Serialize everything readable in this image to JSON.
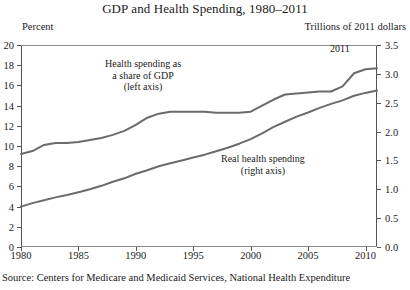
{
  "chart_data": {
    "type": "line",
    "title": "GDP and Health Spending, 1980–2011",
    "xlabel": "",
    "ylabel": "Percent",
    "y2label": "Trillions of 2011 dollars",
    "xlim": [
      1980,
      2011
    ],
    "ylim": [
      0,
      20
    ],
    "y2lim": [
      0,
      3.5
    ],
    "grid": false,
    "legend": "annotations-inline",
    "x_ticks": [
      1980,
      1985,
      1990,
      1995,
      2000,
      2005,
      2010
    ],
    "x_tick_labels": [
      "1980",
      "1985",
      "1990",
      "1995",
      "2000",
      "2005",
      "2010"
    ],
    "y_ticks": [
      0,
      2,
      4,
      6,
      8,
      10,
      12,
      14,
      16,
      18,
      20
    ],
    "y_tick_labels": [
      "0",
      "2",
      "4",
      "6",
      "8",
      "10",
      "12",
      "14",
      "16",
      "18",
      "20"
    ],
    "y2_ticks": [
      0.0,
      0.5,
      1.0,
      1.5,
      2.0,
      2.5,
      3.0,
      3.5
    ],
    "y2_tick_labels": [
      "0.0",
      "0.5",
      "1.0",
      "1.5",
      "2.0",
      "2.5",
      "3.0",
      "3.5"
    ],
    "x": [
      1980,
      1981,
      1982,
      1983,
      1984,
      1985,
      1986,
      1987,
      1988,
      1989,
      1990,
      1991,
      1992,
      1993,
      1994,
      1995,
      1996,
      1997,
      1998,
      1999,
      2000,
      2001,
      2002,
      2003,
      2004,
      2005,
      2006,
      2007,
      2008,
      2009,
      2010,
      2011
    ],
    "series": [
      {
        "name": "Health spending as a share of GDP",
        "axis": "left",
        "units": "percent of GDP",
        "color": "#6b6b6b",
        "values": [
          9.2,
          9.5,
          10.1,
          10.3,
          10.3,
          10.4,
          10.6,
          10.8,
          11.1,
          11.5,
          12.1,
          12.8,
          13.2,
          13.4,
          13.4,
          13.4,
          13.4,
          13.3,
          13.3,
          13.3,
          13.4,
          14.0,
          14.6,
          15.1,
          15.2,
          15.3,
          15.4,
          15.4,
          15.9,
          17.2,
          17.6,
          17.7
        ]
      },
      {
        "name": "Real health spending",
        "axis": "right",
        "units": "trillions of 2011 dollars",
        "color": "#6b6b6b",
        "values": [
          0.7,
          0.76,
          0.81,
          0.86,
          0.9,
          0.95,
          1.0,
          1.06,
          1.13,
          1.19,
          1.27,
          1.33,
          1.4,
          1.45,
          1.5,
          1.55,
          1.6,
          1.66,
          1.72,
          1.79,
          1.87,
          1.97,
          2.08,
          2.17,
          2.26,
          2.33,
          2.41,
          2.48,
          2.54,
          2.62,
          2.67,
          2.71
        ]
      }
    ],
    "annotations": [
      {
        "name": "share-of-gdp-label",
        "lines": [
          "Health spending as",
          "a share of GDP",
          "(left axis)"
        ]
      },
      {
        "name": "real-spending-label",
        "lines": [
          "Real health spending",
          "(right axis)"
        ]
      },
      {
        "name": "end-year-label",
        "text": "2011"
      }
    ],
    "source": "Source: Centers for Medicare and Medicaid Services, National Health Expenditure"
  }
}
